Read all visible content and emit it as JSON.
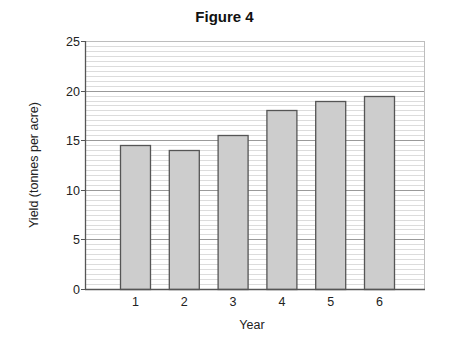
{
  "chart_data": {
    "type": "bar",
    "title": "Figure 4",
    "xlabel": "Year",
    "ylabel": "Yield (tonnes per acre)",
    "categories": [
      "1",
      "2",
      "3",
      "4",
      "5",
      "6"
    ],
    "values": [
      14.5,
      14.0,
      15.5,
      18.0,
      19.0,
      19.5
    ],
    "ylim": [
      0,
      25
    ],
    "yticks": [
      0,
      5,
      10,
      15,
      20,
      25
    ],
    "minor_grid_step": 0.5,
    "grid": true,
    "legend": null,
    "colors": {
      "bar_fill": "#cdcdcd",
      "bar_edge": "#555555",
      "major_grid": "#9a9a9a",
      "minor_grid": "#dcdcdc",
      "axis": "#555555"
    }
  }
}
